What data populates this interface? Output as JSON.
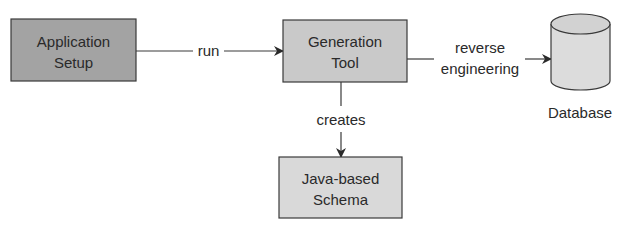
{
  "nodes": {
    "app_setup": {
      "line1": "Application",
      "line2": "Setup",
      "fill": "#a3a3a3"
    },
    "gen_tool": {
      "line1": "Generation",
      "line2": "Tool",
      "fill": "#c9c9c9"
    },
    "schema": {
      "line1": "Java-based",
      "line2": "Schema",
      "fill": "#d9d9d9"
    },
    "database": {
      "label": "Database",
      "fill": "#dcdcdc"
    }
  },
  "edges": {
    "run": "run",
    "reverse_1": "reverse",
    "reverse_2": "engineering",
    "creates": "creates"
  },
  "colors": {
    "stroke": "#3a3a3a"
  }
}
